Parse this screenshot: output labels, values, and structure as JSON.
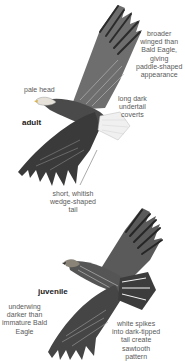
{
  "diagram": {
    "adult": {
      "label": "adult",
      "annotations": [
        {
          "id": "wings",
          "lines": [
            "broader",
            "winged than",
            "Bald Eagle,",
            "giving",
            "paddle-shaped",
            "appearance"
          ]
        },
        {
          "id": "head",
          "lines": [
            "pale head"
          ]
        },
        {
          "id": "coverts",
          "lines": [
            "long dark",
            "undertail",
            "coverts"
          ]
        },
        {
          "id": "tail",
          "lines": [
            "short, whitish",
            "wedge-shaped",
            "tail"
          ]
        }
      ]
    },
    "juvenile": {
      "label": "juvenile",
      "annotations": [
        {
          "id": "underwing",
          "lines": [
            "underwing",
            "darker than",
            "immature Bald",
            "Eagle"
          ]
        },
        {
          "id": "tail",
          "lines": [
            "white spikes",
            "into dark-tipped",
            "tail create",
            "sawtooth",
            "pattern"
          ]
        }
      ]
    },
    "colors": {
      "text": "#5a5a5a",
      "label": "#222222",
      "feather_dark": "#2b2b2b",
      "feather_mid": "#7a7a7a",
      "feather_light": "#d8d8d8"
    }
  }
}
